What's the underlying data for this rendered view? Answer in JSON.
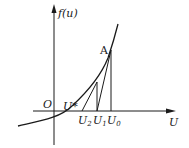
{
  "diagram": {
    "type": "newton-method-illustration",
    "axes": {
      "y_label": "f(u)",
      "x_label": "U",
      "origin_label": "O"
    },
    "points": {
      "tangent_point": "A",
      "root": "U*",
      "iterates": [
        {
          "name": "U",
          "sub": "0"
        },
        {
          "name": "U",
          "sub": "1"
        },
        {
          "name": "U",
          "sub": "2"
        }
      ]
    },
    "colors": {
      "line": "#1a1a1a",
      "background": "#ffffff"
    }
  }
}
